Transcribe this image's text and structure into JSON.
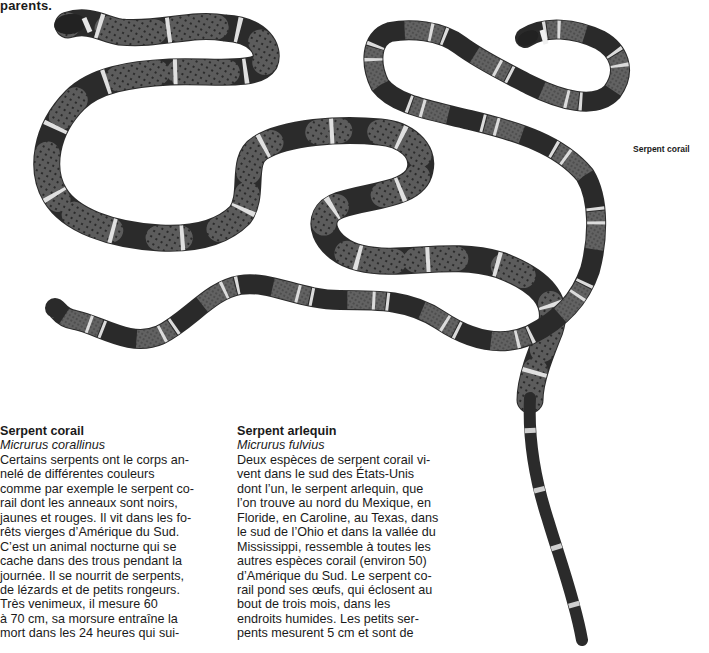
{
  "page": {
    "top_fragment": "parents.",
    "illustration_caption": "Serpent corail"
  },
  "illustration": {
    "subject": "two coral snakes, banded black / pale / red (rendered grey)",
    "band_colors": {
      "black": "#2a2a2a",
      "red": "#5a5a5a",
      "yellow": "#d8d8d8",
      "scale_dot": "#1e1e1e"
    }
  },
  "articles": [
    {
      "title": "Serpent corail",
      "latin_name": "Micrurus corallinus",
      "lines": [
        "Certains serpents ont le corps an-",
        "nelé de différentes couleurs",
        "comme par exemple le serpent co-",
        "rail dont les anneaux sont noirs,",
        "jaunes et rouges. Il vit dans les fo-",
        "rêts vierges d’Amérique du Sud.",
        "C’est un animal nocturne qui se",
        "cache dans des trous pendant la",
        "journée. Il se nourrit de serpents,",
        "de lézards et de petits rongeurs.",
        "Très venimeux, il mesure 60",
        "à 70 cm, sa morsure entraîne la",
        "mort dans les 24 heures qui sui-"
      ]
    },
    {
      "title": "Serpent arlequin",
      "latin_name": "Micrurus fulvius",
      "lines": [
        "Deux espèces de serpent corail vi-",
        "vent dans le sud des États-Unis",
        "dont l’un, le serpent arlequin, que",
        "l’on trouve au nord du Mexique, en",
        "Floride, en Caroline, au Texas, dans",
        "le sud de l’Ohio et dans la vallée du",
        "Mississippi, ressemble à toutes les",
        "autres espèces corail (environ 50)",
        "d’Amérique du Sud. Le serpent co-",
        "rail pond ses œufs, qui éclosent au",
        "bout de trois mois, dans les",
        "endroits humides. Les petits ser-",
        "pents mesurent 5 cm et sont de"
      ]
    }
  ]
}
